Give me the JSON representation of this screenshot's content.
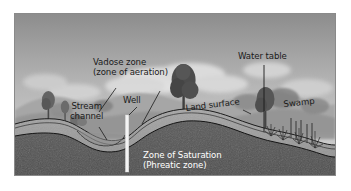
{
  "figure": {
    "border_color": "#8a8a8a",
    "background": "#ffffff"
  },
  "palette": {
    "sky_top": "#8e8e8e",
    "sky_bottom": "#d2d2d2",
    "cloud": "#e4e4e4",
    "far_hill": "#a0a0a0",
    "mid_hill": "#8c8c8c",
    "tree_dark": "#4f4f4f",
    "tree_mid": "#6b6b6b",
    "soil_upper": "#9d9d9d",
    "soil_band": "#b4b4b4",
    "saturated_zone": "#545454",
    "well_fill": "#f2f2f2",
    "line": "#1a1a1a",
    "label_dark": "#1a1a1a",
    "label_light": "#ffffff"
  },
  "labels": {
    "vadose_line1": "Vadose zone",
    "vadose_line2": "(zone of aeration)",
    "well": "Well",
    "stream_line1": "Stream",
    "stream_line2": "channel",
    "land_surface": "Land surface",
    "water_table": "Water table",
    "swamp": "Swamp",
    "saturation_line1": "Zone of Saturation",
    "saturation_line2": "(Phreatic zone)"
  },
  "features": [
    {
      "name": "vadose-zone",
      "kind": "region",
      "label": "Vadose zone (zone of aeration)"
    },
    {
      "name": "zone-of-saturation",
      "kind": "region",
      "label": "Zone of Saturation (Phreatic zone)"
    },
    {
      "name": "water-table",
      "kind": "boundary-line",
      "label": "Water table"
    },
    {
      "name": "land-surface",
      "kind": "boundary-line",
      "label": "Land surface"
    },
    {
      "name": "well",
      "kind": "structure",
      "label": "Well"
    },
    {
      "name": "stream-channel",
      "kind": "landform",
      "label": "Stream channel"
    },
    {
      "name": "swamp",
      "kind": "landform",
      "label": "Swamp"
    }
  ]
}
